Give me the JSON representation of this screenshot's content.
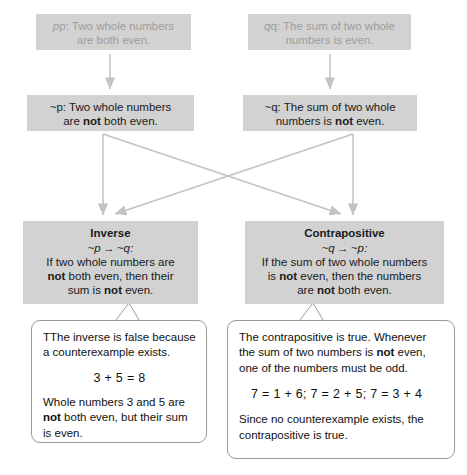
{
  "diagram": {
    "colors": {
      "box_fill": "#d2d2d2",
      "box_text": "#1a1a1a",
      "faded_text": "#9d9d9d",
      "connector": "#c3c3c3",
      "callout_border": "#9a9a9a",
      "callout_fill": "#ffffff"
    }
  },
  "statements": {
    "p": {
      "label": "p",
      "line1": "p: Two whole numbers",
      "line2": "are both even."
    },
    "q": {
      "label": "q",
      "line1": "q: The sum of two whole",
      "line2": "numbers is even."
    },
    "not_p": {
      "label": "~p",
      "line1_a": "~p: Two whole numbers",
      "line2_a": "are ",
      "line2_bold": "not",
      "line2_b": " both even."
    },
    "not_q": {
      "label": "~q",
      "line1_a": "~q: The sum of two whole",
      "line2_a": "numbers is ",
      "line2_bold": "not",
      "line2_b": " even."
    }
  },
  "inverse": {
    "heading": "Inverse",
    "formula_left": "~p",
    "formula_arrow": "→",
    "formula_right": "~q:",
    "line1": "If two whole numbers are",
    "line2_bold": "not",
    "line2_rest": " both even, then their",
    "line3_a": "sum is ",
    "line3_bold": "not",
    "line3_b": " even."
  },
  "contrapositive": {
    "heading": "Contrapositive",
    "formula_left": "~q",
    "formula_arrow": "→",
    "formula_right": "~p:",
    "line1": "If the sum of two whole numbers",
    "line2_a": "is ",
    "line2_bold": "not",
    "line2_b": " even, then the numbers",
    "line3_a": "are ",
    "line3_bold": "not",
    "line3_b": " both even."
  },
  "callout_left": {
    "para1_line1": "TThe inverse is false because a",
    "para1_line2": "counterexample exists.",
    "equation": "3 + 5 = 8",
    "para2_line1": "Whole numbers 3 and 5 are",
    "para2_bold": "not",
    "para2_line2": " both even, but their sum",
    "para2_line3": "is even."
  },
  "callout_right": {
    "para1_line1": "The contrapositive is true.",
    "para1_line2": "Whenever the sum of two numbers",
    "para1_line3_a": "is ",
    "para1_bold": "not",
    "para1_line3_b": " even, one of the numbers",
    "para1_line4": "must be odd.",
    "equation": "7 = 1 + 6; 7 = 2 + 5; 7 = 3 + 4",
    "para2_line1": "Since no counterexample exists,",
    "para2_line2": "the contrapositive is true."
  }
}
